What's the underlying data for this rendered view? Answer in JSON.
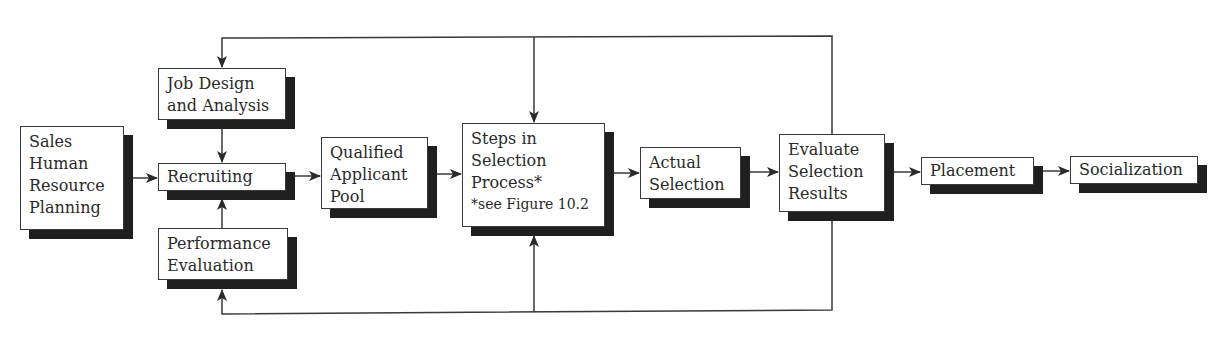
{
  "diagram": {
    "type": "flowchart",
    "nodes": {
      "sales_hrp": {
        "lines": [
          "Sales",
          "Human",
          "Resource",
          "Planning"
        ]
      },
      "job_design": {
        "lines": [
          "Job Design",
          "and Analysis"
        ]
      },
      "recruiting": {
        "lines": [
          "Recruiting"
        ]
      },
      "performance": {
        "lines": [
          "Performance",
          "Evaluation"
        ]
      },
      "applicant_pool": {
        "lines": [
          "Qualified",
          "Applicant",
          "Pool"
        ]
      },
      "selection_steps": {
        "lines": [
          "Steps in",
          "Selection",
          "Process*"
        ],
        "note": "*see Figure 10.2"
      },
      "actual_selection": {
        "lines": [
          "Actual",
          "Selection"
        ]
      },
      "evaluate_results": {
        "lines": [
          "Evaluate",
          "Selection",
          "Results"
        ]
      },
      "placement": {
        "lines": [
          "Placement"
        ]
      },
      "socialization": {
        "lines": [
          "Socialization"
        ]
      }
    },
    "edges": [
      {
        "from": "Sales Human Resource Planning",
        "to": "Recruiting"
      },
      {
        "from": "Job Design and Analysis",
        "to": "Recruiting"
      },
      {
        "from": "Performance Evaluation",
        "to": "Recruiting"
      },
      {
        "from": "Recruiting",
        "to": "Qualified Applicant Pool"
      },
      {
        "from": "Qualified Applicant Pool",
        "to": "Steps in Selection Process"
      },
      {
        "from": "Steps in Selection Process",
        "to": "Actual Selection"
      },
      {
        "from": "Actual Selection",
        "to": "Evaluate Selection Results"
      },
      {
        "from": "Evaluate Selection Results",
        "to": "Placement"
      },
      {
        "from": "Placement",
        "to": "Socialization"
      },
      {
        "from": "Evaluate Selection Results",
        "to": "Job Design and Analysis",
        "kind": "feedback-top"
      },
      {
        "from": "Evaluate Selection Results",
        "to": "Steps in Selection Process",
        "kind": "feedback-top"
      },
      {
        "from": "Evaluate Selection Results",
        "to": "Performance Evaluation",
        "kind": "feedback-bottom"
      },
      {
        "from": "Evaluate Selection Results",
        "to": "Steps in Selection Process",
        "kind": "feedback-bottom"
      }
    ],
    "colors": {
      "line": "#3a3a3a",
      "shadow": "#1f1f1f",
      "background": "#ffffff"
    }
  }
}
